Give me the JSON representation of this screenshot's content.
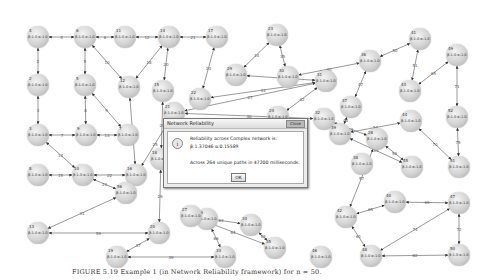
{
  "dialog": {
    "title": "Network Reliability",
    "close_label": "Close",
    "icon": "info-icon",
    "line1": "Reliability across Complex network is:",
    "line2": "β:1.37046 α:0.15589",
    "line3": "Across 264 unique paths in 47200 milliseconds.",
    "ok_label": "OK"
  },
  "caption": "FIGURE 5.19   Example 1 (in Network Reliability framework) for n = 50.",
  "graph": {
    "node_value_label": "β:1.0 α:1.0",
    "nodes": [
      {
        "id": "4",
        "x": 27,
        "y": 26
      },
      {
        "id": "6",
        "x": 74,
        "y": 26
      },
      {
        "id": "11",
        "x": 114,
        "y": 26
      },
      {
        "id": "14",
        "x": 158,
        "y": 26
      },
      {
        "id": "17",
        "x": 206,
        "y": 26
      },
      {
        "id": "23",
        "x": 266,
        "y": 24
      },
      {
        "id": "41",
        "x": 409,
        "y": 28
      },
      {
        "id": "49",
        "x": 446,
        "y": 44
      },
      {
        "id": "2",
        "x": 27,
        "y": 74
      },
      {
        "id": "5",
        "x": 74,
        "y": 74
      },
      {
        "id": "12",
        "x": 118,
        "y": 76
      },
      {
        "id": "15",
        "x": 152,
        "y": 80
      },
      {
        "id": "29",
        "x": 225,
        "y": 64
      },
      {
        "id": "30",
        "x": 277,
        "y": 66
      },
      {
        "id": "31",
        "x": 315,
        "y": 70
      },
      {
        "id": "36",
        "x": 359,
        "y": 50
      },
      {
        "id": "43",
        "x": 399,
        "y": 80
      },
      {
        "id": "3",
        "x": 27,
        "y": 124
      },
      {
        "id": "9",
        "x": 75,
        "y": 124
      },
      {
        "id": "7",
        "x": 117,
        "y": 124
      },
      {
        "id": "22",
        "x": 189,
        "y": 88
      },
      {
        "id": "24",
        "x": 267,
        "y": 106
      },
      {
        "id": "32",
        "x": 313,
        "y": 108
      },
      {
        "id": "37",
        "x": 340,
        "y": 96
      },
      {
        "id": "44",
        "x": 400,
        "y": 110
      },
      {
        "id": "52",
        "x": 446,
        "y": 106
      },
      {
        "id": "21",
        "x": 163,
        "y": 102
      },
      {
        "id": "25",
        "x": 240,
        "y": 123
      },
      {
        "id": "39",
        "x": 329,
        "y": 123
      },
      {
        "id": "28",
        "x": 366,
        "y": 128
      },
      {
        "id": "38",
        "x": 351,
        "y": 153
      },
      {
        "id": "45",
        "x": 401,
        "y": 156
      },
      {
        "id": "51",
        "x": 448,
        "y": 156
      },
      {
        "id": "8",
        "x": 27,
        "y": 164
      },
      {
        "id": "10",
        "x": 72,
        "y": 164
      },
      {
        "id": "16",
        "x": 125,
        "y": 164
      },
      {
        "id": "18",
        "x": 150,
        "y": 148
      },
      {
        "id": "26",
        "x": 196,
        "y": 208
      },
      {
        "id": "27",
        "x": 180,
        "y": 205
      },
      {
        "id": "34",
        "x": 240,
        "y": 214
      },
      {
        "id": "35",
        "x": 264,
        "y": 237
      },
      {
        "id": "40",
        "x": 384,
        "y": 191
      },
      {
        "id": "47",
        "x": 448,
        "y": 192
      },
      {
        "id": "42",
        "x": 335,
        "y": 206
      },
      {
        "id": "46",
        "x": 310,
        "y": 246
      },
      {
        "id": "48",
        "x": 360,
        "y": 245
      },
      {
        "id": "50",
        "x": 448,
        "y": 244
      },
      {
        "id": "56",
        "x": 115,
        "y": 182
      },
      {
        "id": "13",
        "x": 27,
        "y": 222
      },
      {
        "id": "20",
        "x": 148,
        "y": 222
      },
      {
        "id": "19",
        "x": 106,
        "y": 246
      },
      {
        "id": "33",
        "x": 214,
        "y": 246
      }
    ],
    "edges": [
      [
        "4",
        "6",
        "4"
      ],
      [
        "6",
        "11",
        "6"
      ],
      [
        "11",
        "14",
        "12"
      ],
      [
        "14",
        "17",
        "21"
      ],
      [
        "4",
        "2",
        "2"
      ],
      [
        "6",
        "5",
        "5"
      ],
      [
        "6",
        "12",
        "10"
      ],
      [
        "14",
        "12",
        "18"
      ],
      [
        "14",
        "15",
        "20"
      ],
      [
        "17",
        "22",
        "24"
      ],
      [
        "23",
        "29",
        "34"
      ],
      [
        "23",
        "30",
        "35"
      ],
      [
        "29",
        "31",
        "38"
      ],
      [
        "30",
        "36",
        "40"
      ],
      [
        "36",
        "41",
        "50"
      ],
      [
        "41",
        "43",
        "51"
      ],
      [
        "36",
        "37",
        "47"
      ],
      [
        "31",
        "24",
        "42"
      ],
      [
        "2",
        "3",
        "3"
      ],
      [
        "5",
        "9",
        "8"
      ],
      [
        "5",
        "7",
        "9"
      ],
      [
        "3",
        "9",
        "7"
      ],
      [
        "9",
        "7",
        "13"
      ],
      [
        "3",
        "10",
        "14"
      ],
      [
        "12",
        "16",
        "19"
      ],
      [
        "22",
        "31",
        "33"
      ],
      [
        "21",
        "31",
        "27"
      ],
      [
        "21",
        "32",
        "30"
      ],
      [
        "32",
        "28",
        "43"
      ],
      [
        "37",
        "39",
        "48"
      ],
      [
        "39",
        "44",
        "54"
      ],
      [
        "44",
        "51",
        "70"
      ],
      [
        "52",
        "51",
        "75"
      ],
      [
        "39",
        "45",
        "55"
      ],
      [
        "28",
        "45",
        "56"
      ],
      [
        "8",
        "10",
        "15"
      ],
      [
        "10",
        "16",
        "22"
      ],
      [
        "10",
        "56",
        "23"
      ],
      [
        "16",
        "56",
        "26"
      ],
      [
        "16",
        "21",
        "25"
      ],
      [
        "18",
        "15",
        "28"
      ],
      [
        "18",
        "20",
        "29"
      ],
      [
        "56",
        "13",
        "31"
      ],
      [
        "13",
        "20",
        "59"
      ],
      [
        "20",
        "19",
        "37"
      ],
      [
        "19",
        "33",
        "39"
      ],
      [
        "27",
        "26",
        "62"
      ],
      [
        "27",
        "34",
        "63"
      ],
      [
        "27",
        "35",
        "64"
      ],
      [
        "26",
        "33",
        "66"
      ],
      [
        "34",
        "35",
        "58"
      ],
      [
        "28",
        "42",
        "57"
      ],
      [
        "42",
        "40",
        "65"
      ],
      [
        "42",
        "48",
        "61"
      ],
      [
        "40",
        "47",
        "69"
      ],
      [
        "47",
        "50",
        "72"
      ],
      [
        "48",
        "47",
        "74"
      ],
      [
        "48",
        "50",
        "82"
      ],
      [
        "49",
        "43",
        "65"
      ],
      [
        "49",
        "52",
        "71"
      ]
    ]
  }
}
